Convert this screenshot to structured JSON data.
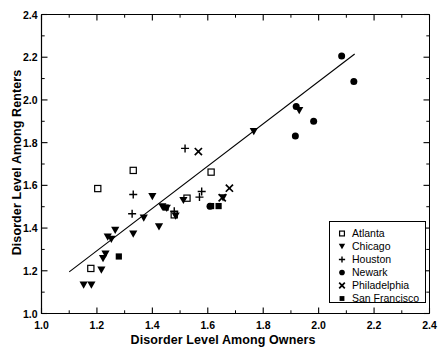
{
  "chart_data": {
    "type": "scatter",
    "title": "",
    "xlabel": "Disorder Level Among Owners",
    "ylabel": "Disorder Level Among Renters",
    "xlim": [
      1.0,
      2.4
    ],
    "ylim": [
      1.0,
      2.4
    ],
    "xticks": [
      "1.0",
      "1.2",
      "1.4",
      "1.6",
      "1.8",
      "2.0",
      "2.2",
      "2.4"
    ],
    "yticks": [
      "1.0",
      "1.2",
      "1.4",
      "1.6",
      "1.8",
      "2.0",
      "2.2",
      "2.4"
    ],
    "xtick_values": [
      1.0,
      1.2,
      1.4,
      1.6,
      1.8,
      2.0,
      2.2,
      2.4
    ],
    "ytick_values": [
      1.0,
      1.2,
      1.4,
      1.6,
      1.8,
      2.0,
      2.2,
      2.4
    ],
    "minor_ticks": true,
    "grid": false,
    "legend_position": "lower-right",
    "trendline": {
      "label": "regression-line",
      "x": [
        1.1,
        2.13
      ],
      "y": [
        1.195,
        2.215
      ]
    },
    "series": [
      {
        "name": "Atlanta",
        "marker": "open-square",
        "color": "#000000",
        "filled": false,
        "points": [
          {
            "x": 1.178,
            "y": 1.211
          },
          {
            "x": 1.203,
            "y": 1.585
          },
          {
            "x": 1.331,
            "y": 1.67
          },
          {
            "x": 1.479,
            "y": 1.462
          },
          {
            "x": 1.525,
            "y": 1.54
          },
          {
            "x": 1.612,
            "y": 1.662
          }
        ]
      },
      {
        "name": "Chicago",
        "marker": "filled-triangle-down",
        "color": "#000000",
        "filled": true,
        "points": [
          {
            "x": 1.152,
            "y": 1.133
          },
          {
            "x": 1.18,
            "y": 1.133
          },
          {
            "x": 1.216,
            "y": 1.203
          },
          {
            "x": 1.222,
            "y": 1.257
          },
          {
            "x": 1.231,
            "y": 1.278
          },
          {
            "x": 1.239,
            "y": 1.358
          },
          {
            "x": 1.252,
            "y": 1.347
          },
          {
            "x": 1.266,
            "y": 1.389
          },
          {
            "x": 1.331,
            "y": 1.372
          },
          {
            "x": 1.369,
            "y": 1.447
          },
          {
            "x": 1.4,
            "y": 1.547
          },
          {
            "x": 1.424,
            "y": 1.406
          },
          {
            "x": 1.436,
            "y": 1.499
          },
          {
            "x": 1.452,
            "y": 1.492
          },
          {
            "x": 1.484,
            "y": 1.456
          },
          {
            "x": 1.512,
            "y": 1.529
          },
          {
            "x": 1.655,
            "y": 1.541
          },
          {
            "x": 1.766,
            "y": 1.852
          },
          {
            "x": 1.93,
            "y": 1.95
          }
        ]
      },
      {
        "name": "Houston",
        "marker": "plus",
        "color": "#000000",
        "filled": true,
        "points": [
          {
            "x": 1.327,
            "y": 1.467
          },
          {
            "x": 1.331,
            "y": 1.557
          },
          {
            "x": 1.479,
            "y": 1.479
          },
          {
            "x": 1.518,
            "y": 1.773
          },
          {
            "x": 1.57,
            "y": 1.545
          },
          {
            "x": 1.578,
            "y": 1.571
          }
        ]
      },
      {
        "name": "Newark",
        "marker": "filled-circle",
        "color": "#000000",
        "filled": true,
        "points": [
          {
            "x": 1.608,
            "y": 1.502
          },
          {
            "x": 1.916,
            "y": 1.831
          },
          {
            "x": 1.919,
            "y": 1.969
          },
          {
            "x": 1.982,
            "y": 1.9
          },
          {
            "x": 2.083,
            "y": 2.206
          },
          {
            "x": 2.127,
            "y": 2.086
          }
        ]
      },
      {
        "name": "Philadelphia",
        "marker": "x-cross",
        "color": "#000000",
        "filled": true,
        "points": [
          {
            "x": 1.566,
            "y": 1.758
          },
          {
            "x": 1.652,
            "y": 1.542
          },
          {
            "x": 1.678,
            "y": 1.587
          }
        ]
      },
      {
        "name": "San Francisco",
        "marker": "filled-square",
        "color": "#000000",
        "filled": true,
        "points": [
          {
            "x": 1.279,
            "y": 1.267
          },
          {
            "x": 1.448,
            "y": 1.496
          },
          {
            "x": 1.612,
            "y": 1.503
          },
          {
            "x": 1.639,
            "y": 1.503
          }
        ]
      }
    ]
  },
  "legend": {
    "items": [
      {
        "label": "Atlanta",
        "marker": "open-square"
      },
      {
        "label": "Chicago",
        "marker": "filled-triangle-down"
      },
      {
        "label": "Houston",
        "marker": "plus"
      },
      {
        "label": "Newark",
        "marker": "filled-circle"
      },
      {
        "label": "Philadelphia",
        "marker": "x-cross"
      },
      {
        "label": "San Francisco",
        "marker": "filled-square"
      }
    ]
  },
  "colors": {
    "foreground": "#000000",
    "background": "#ffffff"
  }
}
